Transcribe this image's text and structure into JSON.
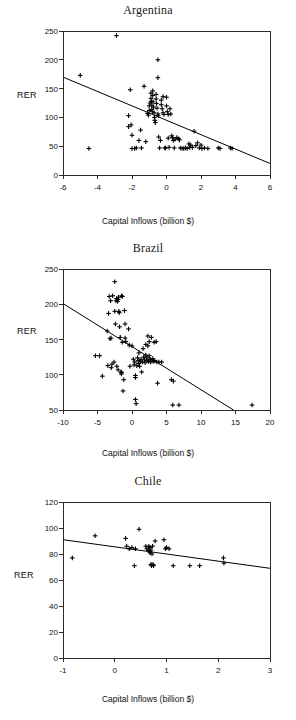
{
  "figure": {
    "panel_count": 3,
    "shared_xlabel": "Capital Inflows (billion $)",
    "shared_ylabel": "RER",
    "marker_symbol": "plus",
    "line_color": "#000000"
  },
  "panels": [
    {
      "id": "argentina",
      "title": "Argentina",
      "xlabel": "Capital Inflows (billion $)",
      "ylabel": "RER"
    },
    {
      "id": "brazil",
      "title": "Brazil",
      "xlabel": "Capital Inflows (billion $)",
      "ylabel": "RER"
    },
    {
      "id": "chile",
      "title": "Chile",
      "xlabel": "Capital Inflows (billion $)",
      "ylabel": "RER"
    }
  ],
  "chart_data": [
    {
      "type": "scatter",
      "title": "Argentina",
      "xlabel": "Capital Inflows (billion $)",
      "ylabel": "RER",
      "xlim": [
        -6,
        6
      ],
      "ylim": [
        0,
        250
      ],
      "xticks": [
        -6,
        -4,
        -2,
        0,
        2,
        4,
        6
      ],
      "yticks": [
        0,
        50,
        100,
        150,
        200,
        250
      ],
      "xtick_labels": [
        "-6",
        "-4",
        "-2",
        "0",
        "2",
        "4",
        "6"
      ],
      "ytick_labels": [
        "0",
        "50",
        "100",
        "150",
        "200",
        "250"
      ],
      "grid": false,
      "legend": "none",
      "trendline": {
        "x": [
          -6,
          6
        ],
        "y": [
          170,
          20
        ]
      },
      "points": [
        [
          -5.0,
          173
        ],
        [
          -4.5,
          46
        ],
        [
          -2.9,
          242
        ],
        [
          -2.2,
          103
        ],
        [
          -2.2,
          84
        ],
        [
          -2.1,
          148
        ],
        [
          -2.05,
          87
        ],
        [
          -2.0,
          69
        ],
        [
          -2.0,
          46
        ],
        [
          -1.85,
          46
        ],
        [
          -1.75,
          47
        ],
        [
          -1.6,
          60
        ],
        [
          -1.5,
          78
        ],
        [
          -1.45,
          47
        ],
        [
          -1.3,
          154
        ],
        [
          -1.2,
          58
        ],
        [
          -1.1,
          107
        ],
        [
          -1.05,
          104
        ],
        [
          -1.0,
          120
        ],
        [
          -1.0,
          112
        ],
        [
          -0.95,
          125
        ],
        [
          -0.9,
          142
        ],
        [
          -0.9,
          133
        ],
        [
          -0.88,
          128
        ],
        [
          -0.85,
          121
        ],
        [
          -0.85,
          114
        ],
        [
          -0.82,
          110
        ],
        [
          -0.8,
          146
        ],
        [
          -0.8,
          138
        ],
        [
          -0.78,
          127
        ],
        [
          -0.75,
          118
        ],
        [
          -0.72,
          108
        ],
        [
          -0.7,
          100
        ],
        [
          -0.68,
          95
        ],
        [
          -0.65,
          91
        ],
        [
          -0.6,
          140
        ],
        [
          -0.6,
          132
        ],
        [
          -0.58,
          124
        ],
        [
          -0.55,
          116
        ],
        [
          -0.5,
          200
        ],
        [
          -0.5,
          169
        ],
        [
          -0.5,
          106
        ],
        [
          -0.48,
          103
        ],
        [
          -0.45,
          66
        ],
        [
          -0.4,
          47
        ],
        [
          -0.35,
          60
        ],
        [
          -0.3,
          130
        ],
        [
          -0.3,
          122
        ],
        [
          -0.25,
          115
        ],
        [
          -0.2,
          136
        ],
        [
          -0.2,
          108
        ],
        [
          -0.15,
          105
        ],
        [
          -0.1,
          47
        ],
        [
          -0.05,
          47
        ],
        [
          0.0,
          135
        ],
        [
          0.0,
          120
        ],
        [
          0.05,
          110
        ],
        [
          0.1,
          105
        ],
        [
          0.1,
          64
        ],
        [
          0.15,
          48
        ],
        [
          0.2,
          115
        ],
        [
          0.25,
          106
        ],
        [
          0.3,
          68
        ],
        [
          0.35,
          65
        ],
        [
          0.4,
          60
        ],
        [
          0.45,
          47
        ],
        [
          0.5,
          62
        ],
        [
          0.6,
          65
        ],
        [
          0.7,
          63
        ],
        [
          0.75,
          61
        ],
        [
          0.8,
          47
        ],
        [
          0.9,
          46
        ],
        [
          1.0,
          46
        ],
        [
          1.1,
          47
        ],
        [
          1.2,
          46
        ],
        [
          1.3,
          54
        ],
        [
          1.35,
          48
        ],
        [
          1.4,
          52
        ],
        [
          1.5,
          48
        ],
        [
          1.6,
          76
        ],
        [
          1.7,
          51
        ],
        [
          1.8,
          56
        ],
        [
          1.9,
          47
        ],
        [
          2.0,
          52
        ],
        [
          2.05,
          46
        ],
        [
          2.2,
          47
        ],
        [
          2.4,
          46
        ],
        [
          3.0,
          47
        ],
        [
          3.1,
          46
        ],
        [
          3.7,
          47
        ],
        [
          3.8,
          46
        ]
      ]
    },
    {
      "type": "scatter",
      "title": "Brazil",
      "xlabel": "Capital Inflows (billion $)",
      "ylabel": "RER",
      "xlim": [
        -10,
        20
      ],
      "ylim": [
        50,
        250
      ],
      "xticks": [
        -10,
        -5,
        0,
        5,
        10,
        15,
        20
      ],
      "yticks": [
        50,
        100,
        150,
        200,
        250
      ],
      "xtick_labels": [
        "-10",
        "-5",
        "0",
        "5",
        "10",
        "15",
        "20"
      ],
      "ytick_labels": [
        "50",
        "100",
        "150",
        "200",
        "250"
      ],
      "grid": false,
      "legend": "none",
      "trendline": {
        "x": [
          -10,
          14.7
        ],
        "y": [
          201,
          50
        ]
      },
      "points": [
        [
          -5.3,
          127
        ],
        [
          -4.7,
          127
        ],
        [
          -4.3,
          98
        ],
        [
          -3.6,
          162
        ],
        [
          -3.5,
          113
        ],
        [
          -3.4,
          187
        ],
        [
          -3.3,
          211
        ],
        [
          -3.2,
          151
        ],
        [
          -3.1,
          205
        ],
        [
          -3.05,
          152
        ],
        [
          -3.0,
          110
        ],
        [
          -2.9,
          115
        ],
        [
          -2.8,
          212
        ],
        [
          -2.6,
          118
        ],
        [
          -2.5,
          232
        ],
        [
          -2.5,
          190
        ],
        [
          -2.4,
          172
        ],
        [
          -2.3,
          205
        ],
        [
          -2.25,
          208
        ],
        [
          -2.2,
          112
        ],
        [
          -2.1,
          204
        ],
        [
          -2.0,
          207
        ],
        [
          -2.0,
          107
        ],
        [
          -1.95,
          210
        ],
        [
          -1.9,
          190
        ],
        [
          -1.85,
          188
        ],
        [
          -1.8,
          168
        ],
        [
          -1.7,
          153
        ],
        [
          -1.6,
          104
        ],
        [
          -1.55,
          101
        ],
        [
          -1.5,
          212
        ],
        [
          -1.5,
          103
        ],
        [
          -1.4,
          211
        ],
        [
          -1.4,
          146
        ],
        [
          -1.3,
          77
        ],
        [
          -1.2,
          93
        ],
        [
          -1.1,
          191
        ],
        [
          -1.0,
          172
        ],
        [
          -1.0,
          152
        ],
        [
          -0.9,
          147
        ],
        [
          -0.5,
          165
        ],
        [
          -0.4,
          142
        ],
        [
          -0.3,
          112
        ],
        [
          0.0,
          141
        ],
        [
          0.2,
          122
        ],
        [
          0.3,
          114
        ],
        [
          0.4,
          118
        ],
        [
          0.5,
          99
        ],
        [
          0.5,
          96
        ],
        [
          0.5,
          65
        ],
        [
          0.6,
          59
        ],
        [
          0.7,
          113
        ],
        [
          0.8,
          124
        ],
        [
          0.9,
          120
        ],
        [
          1.0,
          131
        ],
        [
          1.0,
          116
        ],
        [
          1.1,
          112
        ],
        [
          1.2,
          119
        ],
        [
          1.3,
          122
        ],
        [
          1.4,
          104
        ],
        [
          1.5,
          118
        ],
        [
          1.6,
          137
        ],
        [
          1.7,
          125
        ],
        [
          1.8,
          121
        ],
        [
          1.9,
          117
        ],
        [
          2.0,
          143
        ],
        [
          2.0,
          128
        ],
        [
          2.1,
          124
        ],
        [
          2.2,
          120
        ],
        [
          2.3,
          155
        ],
        [
          2.3,
          141
        ],
        [
          2.4,
          119
        ],
        [
          2.5,
          147
        ],
        [
          2.5,
          127
        ],
        [
          2.6,
          122
        ],
        [
          2.7,
          118
        ],
        [
          2.8,
          153
        ],
        [
          2.9,
          121
        ],
        [
          3.0,
          123
        ],
        [
          3.1,
          119
        ],
        [
          3.2,
          146
        ],
        [
          3.3,
          120
        ],
        [
          3.5,
          147
        ],
        [
          3.6,
          118
        ],
        [
          3.7,
          88
        ],
        [
          3.9,
          118
        ],
        [
          4.3,
          118
        ],
        [
          5.7,
          93
        ],
        [
          5.9,
          57
        ],
        [
          6.0,
          91
        ],
        [
          6.8,
          57
        ],
        [
          17.4,
          57
        ]
      ]
    },
    {
      "type": "scatter",
      "title": "Chile",
      "xlabel": "Capital Inflows (billion $)",
      "ylabel": "RER",
      "xlim": [
        -1,
        3
      ],
      "ylim": [
        0,
        120
      ],
      "xticks": [
        -1,
        0,
        1,
        2,
        3
      ],
      "yticks": [
        0,
        20,
        40,
        60,
        80,
        100,
        120
      ],
      "xtick_labels": [
        "-1",
        "0",
        "1",
        "2",
        "3"
      ],
      "ytick_labels": [
        "0",
        "20",
        "40",
        "60",
        "80",
        "100",
        "120"
      ],
      "grid": false,
      "legend": "none",
      "trendline": {
        "x": [
          -1,
          3
        ],
        "y": [
          91,
          69
        ]
      },
      "points": [
        [
          -0.82,
          77
        ],
        [
          -0.38,
          94
        ],
        [
          0.21,
          92
        ],
        [
          0.23,
          86
        ],
        [
          0.28,
          84
        ],
        [
          0.33,
          85
        ],
        [
          0.38,
          71
        ],
        [
          0.4,
          84
        ],
        [
          0.47,
          99
        ],
        [
          0.6,
          86
        ],
        [
          0.62,
          84
        ],
        [
          0.65,
          83
        ],
        [
          0.66,
          86
        ],
        [
          0.67,
          82
        ],
        [
          0.68,
          85
        ],
        [
          0.68,
          81
        ],
        [
          0.7,
          83
        ],
        [
          0.7,
          72
        ],
        [
          0.71,
          71
        ],
        [
          0.72,
          80
        ],
        [
          0.73,
          86
        ],
        [
          0.74,
          72
        ],
        [
          0.75,
          71
        ],
        [
          0.78,
          90
        ],
        [
          0.95,
          91
        ],
        [
          0.98,
          84
        ],
        [
          1.0,
          85
        ],
        [
          1.05,
          84
        ],
        [
          1.13,
          71
        ],
        [
          1.45,
          71
        ],
        [
          1.64,
          71
        ],
        [
          2.1,
          77
        ],
        [
          2.11,
          73
        ]
      ]
    }
  ]
}
